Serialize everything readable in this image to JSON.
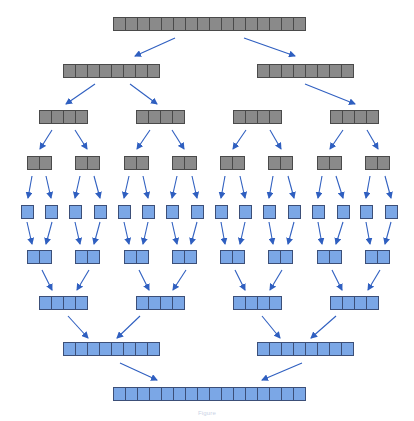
{
  "diagram": {
    "type": "merge-sort-tree",
    "colors": {
      "split_fill": "#8a8a8a",
      "split_stroke": "#4a4a4a",
      "merge_fill": "#7ba7e6",
      "merge_stroke": "#3c4f78",
      "arrow": "#2f5fc0"
    },
    "cell_size": 12,
    "split_levels": [
      {
        "level": 0,
        "y": 17,
        "bars": [
          {
            "x": 113,
            "cells": 16
          }
        ]
      },
      {
        "level": 1,
        "y": 64,
        "bars": [
          {
            "x": 63,
            "cells": 8
          },
          {
            "x": 257,
            "cells": 8
          }
        ]
      },
      {
        "level": 2,
        "y": 110,
        "bars": [
          {
            "x": 39,
            "cells": 4
          },
          {
            "x": 136,
            "cells": 4
          },
          {
            "x": 233,
            "cells": 4
          },
          {
            "x": 330,
            "cells": 4
          }
        ]
      },
      {
        "level": 3,
        "y": 156,
        "bars": [
          {
            "x": 27,
            "cells": 2
          },
          {
            "x": 75,
            "cells": 2
          },
          {
            "x": 124,
            "cells": 2
          },
          {
            "x": 172,
            "cells": 2
          },
          {
            "x": 220,
            "cells": 2
          },
          {
            "x": 268,
            "cells": 2
          },
          {
            "x": 317,
            "cells": 2
          },
          {
            "x": 365,
            "cells": 2
          }
        ]
      }
    ],
    "merge_levels": [
      {
        "level": 4,
        "y": 205,
        "bars": [
          {
            "x": 21,
            "cells": 1
          },
          {
            "x": 45,
            "cells": 1
          },
          {
            "x": 69,
            "cells": 1
          },
          {
            "x": 94,
            "cells": 1
          },
          {
            "x": 118,
            "cells": 1
          },
          {
            "x": 142,
            "cells": 1
          },
          {
            "x": 166,
            "cells": 1
          },
          {
            "x": 191,
            "cells": 1
          },
          {
            "x": 215,
            "cells": 1
          },
          {
            "x": 239,
            "cells": 1
          },
          {
            "x": 263,
            "cells": 1
          },
          {
            "x": 288,
            "cells": 1
          },
          {
            "x": 312,
            "cells": 1
          },
          {
            "x": 337,
            "cells": 1
          },
          {
            "x": 360,
            "cells": 1
          },
          {
            "x": 385,
            "cells": 1
          }
        ]
      },
      {
        "level": 5,
        "y": 250,
        "bars": [
          {
            "x": 27,
            "cells": 2
          },
          {
            "x": 75,
            "cells": 2
          },
          {
            "x": 124,
            "cells": 2
          },
          {
            "x": 172,
            "cells": 2
          },
          {
            "x": 220,
            "cells": 2
          },
          {
            "x": 268,
            "cells": 2
          },
          {
            "x": 317,
            "cells": 2
          },
          {
            "x": 365,
            "cells": 2
          }
        ]
      },
      {
        "level": 6,
        "y": 296,
        "bars": [
          {
            "x": 39,
            "cells": 4
          },
          {
            "x": 136,
            "cells": 4
          },
          {
            "x": 233,
            "cells": 4
          },
          {
            "x": 330,
            "cells": 4
          }
        ]
      },
      {
        "level": 7,
        "y": 342,
        "bars": [
          {
            "x": 63,
            "cells": 8
          },
          {
            "x": 257,
            "cells": 8
          }
        ]
      },
      {
        "level": 8,
        "y": 387,
        "bars": [
          {
            "x": 113,
            "cells": 16
          }
        ]
      }
    ],
    "arrows": [
      [
        175,
        38,
        135,
        56
      ],
      [
        244,
        38,
        295,
        56
      ],
      [
        95,
        84,
        66,
        104
      ],
      [
        130,
        84,
        157,
        104
      ],
      [
        305,
        84,
        355,
        104
      ],
      [
        52,
        130,
        40,
        149
      ],
      [
        75,
        130,
        87,
        149
      ],
      [
        150,
        130,
        137,
        149
      ],
      [
        172,
        130,
        184,
        149
      ],
      [
        246,
        130,
        233,
        149
      ],
      [
        270,
        130,
        281,
        149
      ],
      [
        343,
        130,
        330,
        149
      ],
      [
        367,
        130,
        378,
        149
      ],
      [
        32,
        176,
        28,
        198
      ],
      [
        46,
        176,
        51,
        198
      ],
      [
        80,
        176,
        75,
        198
      ],
      [
        94,
        176,
        100,
        198
      ],
      [
        129,
        176,
        124,
        198
      ],
      [
        143,
        176,
        148,
        198
      ],
      [
        177,
        176,
        172,
        198
      ],
      [
        192,
        176,
        197,
        198
      ],
      [
        225,
        176,
        221,
        198
      ],
      [
        240,
        176,
        245,
        198
      ],
      [
        273,
        176,
        269,
        198
      ],
      [
        288,
        176,
        294,
        198
      ],
      [
        322,
        176,
        318,
        198
      ],
      [
        336,
        176,
        343,
        198
      ],
      [
        370,
        176,
        366,
        198
      ],
      [
        385,
        176,
        391,
        198
      ],
      [
        27,
        222,
        32,
        244
      ],
      [
        52,
        222,
        46,
        244
      ],
      [
        75,
        222,
        80,
        244
      ],
      [
        100,
        222,
        94,
        244
      ],
      [
        124,
        222,
        129,
        244
      ],
      [
        148,
        222,
        143,
        244
      ],
      [
        172,
        222,
        177,
        244
      ],
      [
        197,
        222,
        191,
        244
      ],
      [
        221,
        222,
        225,
        244
      ],
      [
        245,
        222,
        240,
        244
      ],
      [
        269,
        222,
        273,
        244
      ],
      [
        294,
        222,
        288,
        244
      ],
      [
        318,
        222,
        322,
        244
      ],
      [
        343,
        222,
        336,
        244
      ],
      [
        366,
        222,
        370,
        244
      ],
      [
        391,
        222,
        385,
        244
      ],
      [
        42,
        270,
        52,
        290
      ],
      [
        89,
        270,
        77,
        290
      ],
      [
        139,
        270,
        149,
        290
      ],
      [
        186,
        270,
        173,
        290
      ],
      [
        235,
        270,
        245,
        290
      ],
      [
        282,
        270,
        270,
        290
      ],
      [
        332,
        270,
        342,
        290
      ],
      [
        380,
        270,
        368,
        290
      ],
      [
        68,
        316,
        88,
        338
      ],
      [
        140,
        316,
        117,
        338
      ],
      [
        262,
        316,
        280,
        338
      ],
      [
        336,
        316,
        311,
        338
      ],
      [
        120,
        363,
        157,
        380
      ],
      [
        302,
        363,
        262,
        380
      ]
    ]
  },
  "caption": "Figure"
}
